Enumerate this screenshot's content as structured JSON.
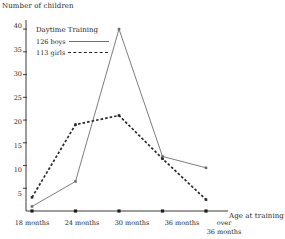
{
  "chart_data": {
    "type": "line",
    "title": "",
    "xlabel": "Age at training",
    "ylabel": "Number of children",
    "categories": [
      "18 months",
      "24 months",
      "30 months",
      "36 months",
      "over\n36 months"
    ],
    "xtick_labels": [
      "18 months",
      "24 months",
      "30 months",
      "36 months",
      "over",
      "36 months"
    ],
    "ylim": [
      0,
      42
    ],
    "ytick_values": [
      5,
      10,
      15,
      20,
      25,
      30,
      35,
      40
    ],
    "ytick_labels": [
      "5",
      "10",
      "15",
      "20",
      "25",
      "30",
      "35",
      "40"
    ],
    "grid": false,
    "legend_position": "upper-left-inside",
    "legend_title": "Daytime Training",
    "series": [
      {
        "name": "126 boys",
        "label": "126 boys",
        "style": "solid",
        "color": "#6e6e6e",
        "values": [
          1,
          6.5,
          40,
          12,
          9.5
        ]
      },
      {
        "name": "113 girls",
        "label": "113 girls",
        "style": "dashed",
        "color": "#2a2a2a",
        "values": [
          3,
          19,
          21,
          11.5,
          2.5
        ]
      }
    ]
  },
  "axes": {
    "y_title": "Number of children",
    "x_title": "Age at training"
  },
  "legend": {
    "title": "Daytime Training",
    "boys_label": "126 boys",
    "girls_label": "113 girls"
  },
  "xticks": [
    {
      "line1": "18 months",
      "line2": ""
    },
    {
      "line1": "24 months",
      "line2": ""
    },
    {
      "line1": "30 months",
      "line2": ""
    },
    {
      "line1": "36 months",
      "line2": ""
    },
    {
      "line1": "over",
      "line2": "36 months"
    }
  ],
  "yticks": [
    "40",
    "35",
    "30",
    "25",
    "20",
    "15",
    "10",
    "5"
  ],
  "colors": {
    "axis": "#3a3a3a",
    "boys_line": "#6e6e6e",
    "girls_line": "#2a2a2a",
    "text": "#1e1e1e",
    "background": "#ffffff"
  }
}
